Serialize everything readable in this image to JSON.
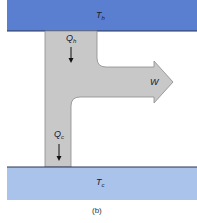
{
  "diagram": {
    "hot_reservoir": {
      "label": "T",
      "sub": "h",
      "color": "#5b7fd0"
    },
    "cold_reservoir": {
      "label": "T",
      "sub": "c",
      "color": "#a9c3ea"
    },
    "heat_in": {
      "label": "Q",
      "sub": "h"
    },
    "heat_out": {
      "label": "Q",
      "sub": "c"
    },
    "work": {
      "label": "W"
    },
    "flow_color": "#c8c8c8",
    "caption": "(b)"
  }
}
